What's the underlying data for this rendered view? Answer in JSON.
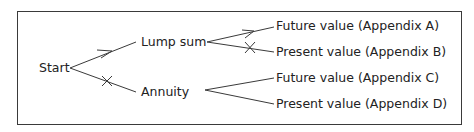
{
  "diagram": {
    "type": "decision-tree",
    "root": "Start",
    "branches": [
      {
        "label": "Lump sum",
        "selected": true,
        "children": [
          {
            "label": "Future value (Appendix A)",
            "selected": true
          },
          {
            "label": "Present value (Appendix B)",
            "selected": false
          }
        ]
      },
      {
        "label": "Annuity",
        "selected": false,
        "children": [
          {
            "label": "Future value (Appendix C)",
            "selected": null
          },
          {
            "label": "Present value (Appendix D)",
            "selected": null
          }
        ]
      }
    ],
    "markers": {
      "arrow": "chosen path",
      "cross": "rejected path"
    },
    "line_color": "#3a3a3a"
  }
}
